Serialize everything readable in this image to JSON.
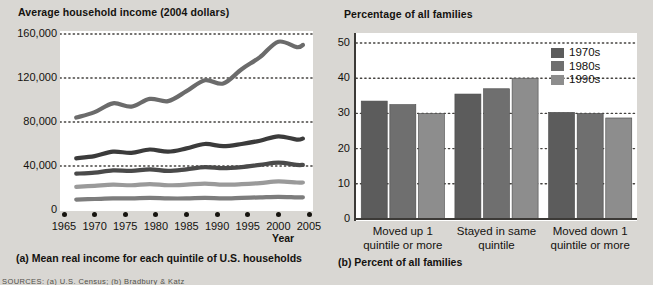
{
  "figure": {
    "panel_a": {
      "title": "Average household income (2004 dollars)",
      "caption": "(a) Mean real income for each quintile of U.S. households",
      "x_axis_name": "Year"
    },
    "panel_b": {
      "title": "Percentage of all families",
      "caption": "(b) Percent of all families"
    },
    "source": "SOURCES: (a) U.S. Census; (b) Bradbury & Katz"
  },
  "colors": {
    "background": "#d9d7d3",
    "plot_background": "#ffffff",
    "axis": "#3c3a37",
    "grid_dot": "#44423f",
    "series_1970s": "#5c5c5c",
    "series_1980s": "#6f6f6f",
    "series_1990s": "#8d8d8d",
    "line_q5": "#6b6b6b",
    "line_q4": "#3b3b3b",
    "line_q3": "#4a4a4a",
    "line_q2": "#9a9a9a",
    "line_q1": "#7d7d7d"
  },
  "chart_data": [
    {
      "type": "line",
      "panel": "a",
      "title": "Average household income (2004 dollars)",
      "caption": "(a) Mean real income for each quintile of U.S. households",
      "xlabel": "Year",
      "ylabel": "",
      "xlim": [
        1965,
        2005
      ],
      "ylim": [
        0,
        160000
      ],
      "xticks": [
        1965,
        1970,
        1975,
        1980,
        1985,
        1990,
        1995,
        2000,
        2005
      ],
      "xtick_labels": [
        "1965",
        "1970",
        "1975",
        "1980",
        "1985",
        "1990",
        "1995",
        "2000",
        "2005"
      ],
      "yticks": [
        0,
        40000,
        80000,
        120000,
        160000
      ],
      "ytick_labels": [
        "0",
        "40,000",
        "80,000",
        "120,000",
        "160,000"
      ],
      "grid": "horizontal-dotted",
      "legend_position": "none",
      "x": [
        1967,
        1970,
        1973,
        1976,
        1979,
        1982,
        1985,
        1988,
        1991,
        1994,
        1997,
        2000,
        2003,
        2004
      ],
      "series": [
        {
          "name": "Highest quintile",
          "color": "#6b6b6b",
          "values": [
            84000,
            89000,
            97000,
            94000,
            101000,
            99000,
            108000,
            118000,
            115000,
            128000,
            139000,
            153000,
            148000,
            150000
          ]
        },
        {
          "name": "Fourth quintile",
          "color": "#3b3b3b",
          "values": [
            47000,
            49000,
            53000,
            52000,
            55000,
            53000,
            56000,
            60000,
            58000,
            60000,
            63000,
            67000,
            64000,
            65000
          ]
        },
        {
          "name": "Third quintile",
          "color": "#4a4a4a",
          "values": [
            33000,
            34000,
            36000,
            35500,
            37000,
            35500,
            37000,
            39000,
            38000,
            39000,
            41000,
            43000,
            41000,
            41000
          ]
        },
        {
          "name": "Second quintile",
          "color": "#9a9a9a",
          "values": [
            21000,
            22000,
            23000,
            22500,
            23500,
            22500,
            23000,
            24000,
            23000,
            23500,
            24500,
            26000,
            25000,
            25000
          ]
        },
        {
          "name": "Lowest quintile",
          "color": "#7d7d7d",
          "values": [
            9500,
            10000,
            10500,
            10500,
            11000,
            10500,
            10500,
            11000,
            10500,
            11000,
            11500,
            12000,
            11500,
            11500
          ]
        }
      ]
    },
    {
      "type": "bar",
      "panel": "b",
      "title": "Percentage of all families",
      "caption": "(b) Percent of all families",
      "xlabel": "",
      "ylabel": "",
      "ylim": [
        0,
        50
      ],
      "yticks": [
        0,
        10,
        20,
        30,
        40,
        50
      ],
      "ytick_labels": [
        "0",
        "10",
        "20",
        "30",
        "40",
        "50"
      ],
      "grid": "horizontal-dotted",
      "legend_position": "top-right",
      "categories": [
        "Moved up 1 quintile or more",
        "Stayed in same quintile",
        "Moved down 1 quintile or more"
      ],
      "category_lines": [
        [
          "Moved up 1",
          "quintile or more"
        ],
        [
          "Stayed in same",
          "quintile"
        ],
        [
          "Moved down 1",
          "quintile or more"
        ]
      ],
      "series": [
        {
          "name": "1970s",
          "color": "#5c5c5c",
          "values": [
            33.5,
            35.5,
            30.3
          ]
        },
        {
          "name": "1980s",
          "color": "#6f6f6f",
          "values": [
            32.5,
            37.0,
            30.0
          ]
        },
        {
          "name": "1990s",
          "color": "#8d8d8d",
          "values": [
            30.0,
            40.0,
            28.7
          ]
        }
      ]
    }
  ]
}
